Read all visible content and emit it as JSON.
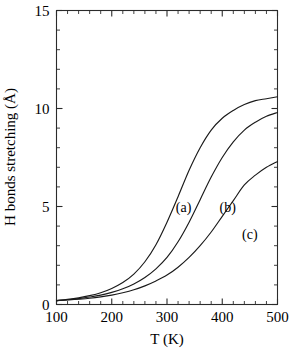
{
  "chart_data": {
    "type": "line",
    "title": "",
    "xlabel": "T (K)",
    "ylabel": "H bonds stretching (Å)",
    "xlim": [
      100,
      500
    ],
    "ylim": [
      0,
      15
    ],
    "xticks": [
      100,
      200,
      300,
      400,
      500
    ],
    "yticks": [
      0,
      5,
      10,
      15
    ],
    "xtick_labels": [
      "100",
      "200",
      "300",
      "400",
      "500"
    ],
    "ytick_labels": [
      "0",
      "5",
      "10",
      "15"
    ],
    "x_minor_step": 20,
    "y_minor_step": 1,
    "grid": false,
    "legend": "inline-curve-labels",
    "series": [
      {
        "name": "(a)",
        "label": "(a)",
        "label_x": 330,
        "label_y": 5.0,
        "midpoint_K": 320,
        "plateau": 10.6,
        "x": [
          100,
          120,
          140,
          160,
          180,
          200,
          220,
          240,
          260,
          280,
          300,
          320,
          340,
          360,
          380,
          400,
          420,
          440,
          460,
          480,
          500
        ],
        "y": [
          0.2,
          0.26,
          0.34,
          0.45,
          0.6,
          0.82,
          1.12,
          1.55,
          2.18,
          3.05,
          4.2,
          5.5,
          6.85,
          8.0,
          8.9,
          9.5,
          9.9,
          10.2,
          10.4,
          10.5,
          10.6
        ]
      },
      {
        "name": "(b)",
        "label": "(b)",
        "label_x": 410,
        "label_y": 5.0,
        "midpoint_K": 400,
        "plateau": 9.8,
        "x": [
          100,
          120,
          140,
          160,
          180,
          200,
          220,
          240,
          260,
          280,
          300,
          320,
          340,
          360,
          380,
          400,
          420,
          440,
          460,
          480,
          500
        ],
        "y": [
          0.2,
          0.24,
          0.3,
          0.38,
          0.48,
          0.62,
          0.8,
          1.05,
          1.38,
          1.82,
          2.4,
          3.2,
          4.2,
          5.35,
          6.5,
          7.5,
          8.3,
          8.9,
          9.3,
          9.6,
          9.8
        ]
      },
      {
        "name": "(c)",
        "label": "(c)",
        "label_x": 450,
        "label_y": 3.6,
        "midpoint_K": 460,
        "plateau": 7.3,
        "x": [
          100,
          120,
          140,
          160,
          180,
          200,
          220,
          240,
          260,
          280,
          300,
          320,
          340,
          360,
          380,
          400,
          420,
          440,
          460,
          480,
          500
        ],
        "y": [
          0.2,
          0.23,
          0.27,
          0.32,
          0.39,
          0.48,
          0.6,
          0.75,
          0.95,
          1.2,
          1.5,
          1.9,
          2.4,
          3.0,
          3.7,
          4.5,
          5.3,
          6.1,
          6.6,
          7.0,
          7.3
        ]
      }
    ]
  }
}
